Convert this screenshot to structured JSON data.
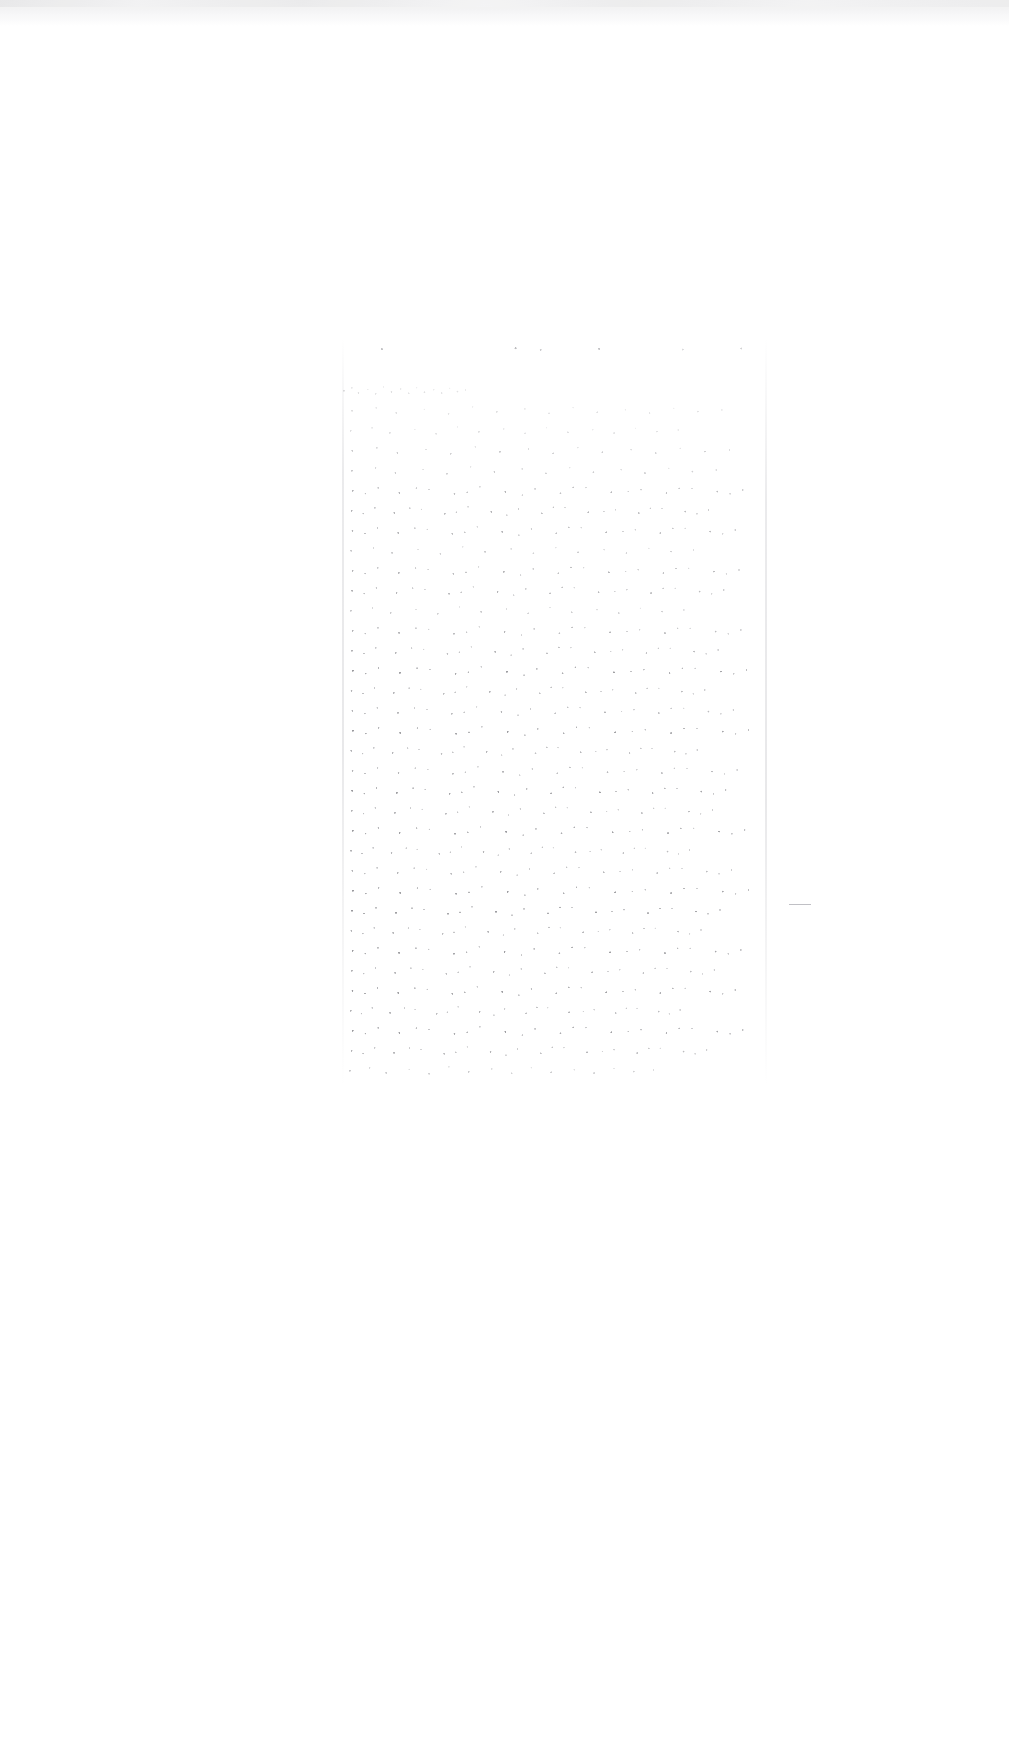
{
  "document": {
    "kind": "scanned-page",
    "condition": "severely faded / illegible",
    "legibility_note": "No characters are recoverable at any magnification; only residual ink speckle survives.",
    "page_background": "#ffffff",
    "page_width": 1009,
    "page_height": 1754,
    "visible_text": ""
  },
  "scan_artifacts": {
    "top_edge_band": {
      "present": true,
      "label": "grey scanner edge band",
      "color": "#ededee",
      "height_px": 26
    },
    "residual_stroke": {
      "present": true,
      "label": "short dark horizontal stroke near right margin",
      "color": "#8d8d95"
    }
  },
  "text_block": {
    "label": "single centred column of faded body text",
    "left_px": 340,
    "top_px": 338,
    "width_px": 430,
    "height_px": 748,
    "column_count": 1,
    "left_margin_px": 340,
    "right_margin_px": 770,
    "line_spacing_px": 20,
    "ink_color": "#3c3c44",
    "lines": [
      {
        "top": 4,
        "width": 418,
        "density": "faint",
        "role": "heading"
      },
      {
        "top": 46,
        "width": 132,
        "density": "faint",
        "role": "body"
      },
      {
        "top": 66,
        "width": 402,
        "density": "faint",
        "role": "body"
      },
      {
        "top": 86,
        "width": 356,
        "density": "faint",
        "role": "body"
      },
      {
        "top": 106,
        "width": 410,
        "density": "low",
        "role": "body"
      },
      {
        "top": 126,
        "width": 396,
        "density": "low",
        "role": "body"
      },
      {
        "top": 146,
        "width": 424,
        "density": "med",
        "role": "body"
      },
      {
        "top": 166,
        "width": 388,
        "density": "med",
        "role": "body"
      },
      {
        "top": 186,
        "width": 416,
        "density": "med",
        "role": "body"
      },
      {
        "top": 206,
        "width": 372,
        "density": "low",
        "role": "body"
      },
      {
        "top": 226,
        "width": 420,
        "density": "med",
        "role": "body"
      },
      {
        "top": 246,
        "width": 404,
        "density": "med",
        "role": "body"
      },
      {
        "top": 266,
        "width": 362,
        "density": "low",
        "role": "body"
      },
      {
        "top": 286,
        "width": 422,
        "density": "med",
        "role": "body"
      },
      {
        "top": 306,
        "width": 398,
        "density": "med",
        "role": "body"
      },
      {
        "top": 326,
        "width": 428,
        "density": "high",
        "role": "body"
      },
      {
        "top": 346,
        "width": 384,
        "density": "med",
        "role": "body"
      },
      {
        "top": 366,
        "width": 414,
        "density": "med",
        "role": "body"
      },
      {
        "top": 386,
        "width": 430,
        "density": "high",
        "role": "body"
      },
      {
        "top": 406,
        "width": 376,
        "density": "med",
        "role": "body"
      },
      {
        "top": 426,
        "width": 418,
        "density": "med",
        "role": "body"
      },
      {
        "top": 446,
        "width": 406,
        "density": "high",
        "role": "body"
      },
      {
        "top": 466,
        "width": 392,
        "density": "med",
        "role": "body"
      },
      {
        "top": 486,
        "width": 426,
        "density": "high",
        "role": "body"
      },
      {
        "top": 506,
        "width": 368,
        "density": "med",
        "role": "body"
      },
      {
        "top": 526,
        "width": 412,
        "density": "med",
        "role": "body"
      },
      {
        "top": 546,
        "width": 430,
        "density": "high",
        "role": "body"
      },
      {
        "top": 566,
        "width": 400,
        "density": "high",
        "role": "body"
      },
      {
        "top": 586,
        "width": 380,
        "density": "med",
        "role": "body"
      },
      {
        "top": 606,
        "width": 422,
        "density": "high",
        "role": "body"
      },
      {
        "top": 626,
        "width": 394,
        "density": "med",
        "role": "body"
      },
      {
        "top": 646,
        "width": 416,
        "density": "high",
        "role": "body"
      },
      {
        "top": 666,
        "width": 358,
        "density": "med",
        "role": "body"
      },
      {
        "top": 686,
        "width": 424,
        "density": "high",
        "role": "body"
      },
      {
        "top": 706,
        "width": 386,
        "density": "med",
        "role": "body"
      },
      {
        "top": 726,
        "width": 330,
        "density": "low",
        "role": "body"
      }
    ]
  },
  "footer": {
    "present": false,
    "page_number": ""
  }
}
